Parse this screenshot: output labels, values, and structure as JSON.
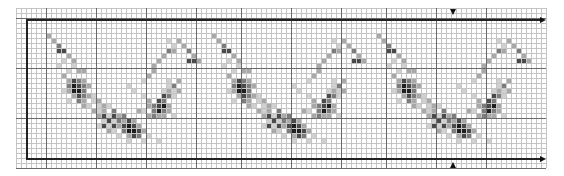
{
  "pattern": {
    "title": "",
    "grid": {
      "origin_x": 16,
      "origin_y": 8,
      "cell_size": 5,
      "cols": 106,
      "rows": 32,
      "major_every": 10,
      "major_cols": [
        6,
        16,
        26,
        36,
        45,
        55,
        65,
        74,
        84,
        94
      ],
      "major_rows": [
        2,
        12,
        22,
        32
      ]
    },
    "repeat_box": {
      "left_x": 26,
      "top_y": 19,
      "right_x": 540,
      "bottom_y": 158,
      "top_marker_x": 453,
      "bottom_marker_x": 453
    },
    "colors": {
      "shade_1": "#d0d0d0",
      "shade_2": "#a8a8a8",
      "shade_3": "#7c7c7c",
      "shade_4": "#4a4a4a",
      "shade_5": "#1e1e1e"
    },
    "motif_period_cols": 33,
    "motif_repeats": [
      0,
      1,
      2
    ],
    "motif_cells": [
      [
        6,
        5,
        2
      ],
      [
        7,
        6,
        2
      ],
      [
        8,
        7,
        3
      ],
      [
        8,
        8,
        4
      ],
      [
        9,
        8,
        4
      ],
      [
        10,
        9,
        2
      ],
      [
        11,
        10,
        2
      ],
      [
        9,
        10,
        1
      ],
      [
        8,
        11,
        1
      ],
      [
        11,
        11,
        1
      ],
      [
        12,
        12,
        2
      ],
      [
        13,
        12,
        2
      ],
      [
        10,
        12,
        1
      ],
      [
        9,
        13,
        2
      ],
      [
        11,
        14,
        4
      ],
      [
        12,
        14,
        3
      ],
      [
        10,
        14,
        2
      ],
      [
        13,
        14,
        2
      ],
      [
        11,
        15,
        5
      ],
      [
        12,
        15,
        4
      ],
      [
        10,
        15,
        3
      ],
      [
        13,
        15,
        3
      ],
      [
        14,
        15,
        2
      ],
      [
        11,
        16,
        5
      ],
      [
        12,
        16,
        5
      ],
      [
        13,
        16,
        3
      ],
      [
        10,
        16,
        2
      ],
      [
        9,
        16,
        1
      ],
      [
        12,
        17,
        4
      ],
      [
        13,
        17,
        3
      ],
      [
        11,
        17,
        2
      ],
      [
        14,
        17,
        2
      ],
      [
        15,
        17,
        1
      ],
      [
        13,
        18,
        2
      ],
      [
        12,
        18,
        3
      ],
      [
        10,
        18,
        1
      ],
      [
        15,
        18,
        1
      ],
      [
        16,
        18,
        2
      ],
      [
        13,
        19,
        2
      ],
      [
        14,
        19,
        1
      ],
      [
        17,
        19,
        2
      ],
      [
        18,
        19,
        1
      ],
      [
        16,
        19,
        1
      ],
      [
        15,
        20,
        2
      ],
      [
        16,
        20,
        1
      ],
      [
        17,
        20,
        2
      ],
      [
        19,
        20,
        3
      ],
      [
        16,
        21,
        2
      ],
      [
        17,
        21,
        4
      ],
      [
        18,
        21,
        1
      ],
      [
        19,
        21,
        4
      ],
      [
        20,
        21,
        2
      ],
      [
        21,
        21,
        3
      ],
      [
        17,
        22,
        1
      ],
      [
        18,
        22,
        4
      ],
      [
        19,
        22,
        1
      ],
      [
        20,
        22,
        3
      ],
      [
        21,
        22,
        2
      ],
      [
        22,
        22,
        4
      ],
      [
        23,
        22,
        2
      ],
      [
        16,
        23,
        1
      ],
      [
        17,
        23,
        4
      ],
      [
        18,
        23,
        1
      ],
      [
        19,
        23,
        4
      ],
      [
        20,
        23,
        2
      ],
      [
        21,
        23,
        4
      ],
      [
        22,
        23,
        5
      ],
      [
        23,
        23,
        4
      ],
      [
        24,
        23,
        2
      ],
      [
        18,
        24,
        2
      ],
      [
        19,
        24,
        1
      ],
      [
        21,
        24,
        3
      ],
      [
        22,
        24,
        5
      ],
      [
        23,
        24,
        5
      ],
      [
        24,
        24,
        4
      ],
      [
        25,
        24,
        2
      ],
      [
        20,
        25,
        1
      ],
      [
        22,
        25,
        2
      ],
      [
        23,
        25,
        4
      ],
      [
        24,
        25,
        3
      ],
      [
        26,
        25,
        1
      ],
      [
        22,
        26,
        1
      ],
      [
        25,
        26,
        1
      ],
      [
        28,
        26,
        1
      ],
      [
        24,
        20,
        2
      ],
      [
        25,
        20,
        1
      ],
      [
        26,
        19,
        2
      ],
      [
        27,
        19,
        3
      ],
      [
        28,
        18,
        4
      ],
      [
        29,
        18,
        3
      ],
      [
        30,
        17,
        3
      ],
      [
        29,
        17,
        4
      ],
      [
        28,
        19,
        4
      ],
      [
        29,
        19,
        5
      ],
      [
        30,
        19,
        2
      ],
      [
        27,
        20,
        3
      ],
      [
        28,
        20,
        5
      ],
      [
        29,
        20,
        3
      ],
      [
        30,
        20,
        2
      ],
      [
        26,
        21,
        2
      ],
      [
        27,
        21,
        3
      ],
      [
        28,
        21,
        2
      ],
      [
        29,
        21,
        2
      ],
      [
        31,
        21,
        1
      ],
      [
        30,
        16,
        2
      ],
      [
        29,
        16,
        1
      ],
      [
        31,
        15,
        3
      ],
      [
        30,
        15,
        1
      ],
      [
        32,
        14,
        2
      ],
      [
        30,
        14,
        1
      ],
      [
        31,
        16,
        1
      ],
      [
        32,
        16,
        2
      ],
      [
        31,
        17,
        1
      ],
      [
        22,
        15,
        1
      ],
      [
        23,
        16,
        1
      ],
      [
        25,
        17,
        1
      ],
      [
        26,
        18,
        2
      ],
      [
        27,
        11,
        2
      ],
      [
        28,
        10,
        2
      ],
      [
        29,
        9,
        2
      ],
      [
        30,
        8,
        3
      ],
      [
        31,
        8,
        2
      ],
      [
        31,
        7,
        1
      ],
      [
        32,
        6,
        2
      ],
      [
        30,
        6,
        1
      ],
      [
        33,
        7,
        2
      ],
      [
        34,
        8,
        3
      ],
      [
        35,
        9,
        2
      ],
      [
        34,
        10,
        4
      ],
      [
        35,
        10,
        4
      ],
      [
        36,
        10,
        2
      ],
      [
        25,
        14,
        1
      ],
      [
        26,
        13,
        2
      ],
      [
        27,
        12,
        2
      ]
    ]
  }
}
